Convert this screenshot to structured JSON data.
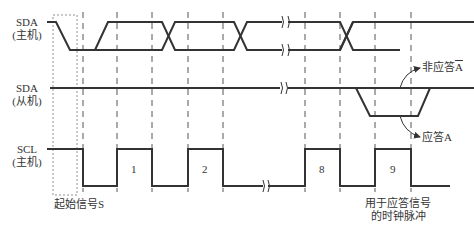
{
  "signals": {
    "sda_master": {
      "name": "SDA",
      "role": "(主机)"
    },
    "sda_slave": {
      "name": "SDA",
      "role": "(从机)"
    },
    "scl_master": {
      "name": "SCL",
      "role": "(主机)"
    }
  },
  "annotations": {
    "start_signal": "起始信号S",
    "nack": "非应答",
    "nack_symbol": "A",
    "ack": "应答A",
    "ack_clock_line1": "用于应答信号",
    "ack_clock_line2": "的时钟脉冲"
  },
  "clock_pulses": [
    "1",
    "2",
    "8",
    "9"
  ],
  "colors": {
    "line": "#333333",
    "dashed": "#555555",
    "background": "#ffffff"
  }
}
